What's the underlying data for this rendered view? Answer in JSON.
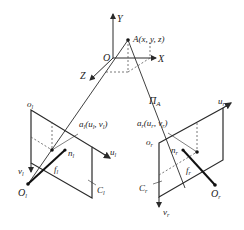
{
  "diagram": {
    "type": "stereo-camera-geometry",
    "world": {
      "axes": {
        "y_label": "Y",
        "x_label": "X",
        "z_label": "Z",
        "origin_label": "O"
      },
      "point_label": "A(x, y, z)",
      "plane_label": "Π",
      "plane_subscript": "A"
    },
    "left_camera": {
      "origin_label": "o",
      "origin_sub": "l",
      "u_label": "u",
      "u_sub": "l",
      "v_label": "v",
      "v_sub": "l",
      "image_point_label": "a",
      "image_point_sub": "l",
      "image_point_coords": "(u",
      "image_point_coords_sub1": "l",
      "image_point_coords_mid": ", v",
      "image_point_coords_sub2": "l",
      "image_point_coords_end": ")",
      "normal_label": "n",
      "normal_sub": "l",
      "focal_label": "f",
      "focal_sub": "l",
      "optical_center_label": "O",
      "optical_center_sub": "l",
      "plane_label": "C",
      "plane_sub": "l"
    },
    "right_camera": {
      "origin_label": "o",
      "origin_sub": "r",
      "u_label": "u",
      "u_sub": "r",
      "v_label": "v",
      "v_sub": "r",
      "image_point_label": "a",
      "image_point_sub": "r",
      "image_point_coords": "(u",
      "image_point_coords_sub1": "r",
      "image_point_coords_mid": ", v",
      "image_point_coords_sub2": "r",
      "image_point_coords_end": ")",
      "normal_label": "n",
      "normal_sub": "r",
      "focal_label": "f",
      "focal_sub": "r",
      "optical_center_label": "O",
      "optical_center_sub": "r",
      "plane_label": "C",
      "plane_sub": "r"
    },
    "colors": {
      "line": "#2a2a2a",
      "dashed": "#555555",
      "background": "#ffffff"
    }
  }
}
